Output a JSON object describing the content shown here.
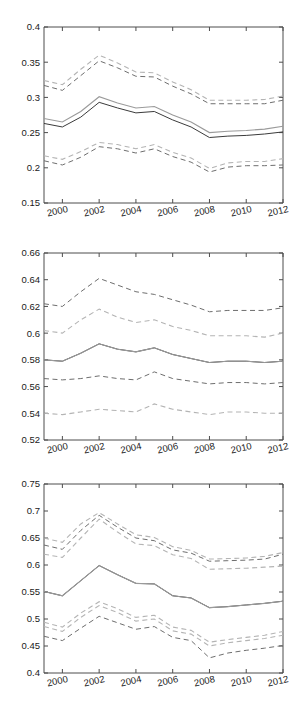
{
  "figure": {
    "background": "#ffffff",
    "panel_count": 3,
    "colors": {
      "axis": "#4d4d4d",
      "solid_dark": "#3b3b3b",
      "solid_light": "#9a9a9a",
      "dash_dark": "#6e6e6e",
      "dash_light": "#b4b4b4"
    }
  },
  "chart_data": [
    {
      "type": "line",
      "title": "",
      "xlabel": "",
      "ylabel": "",
      "grid": false,
      "legend": "none",
      "xlim": [
        1999,
        2012
      ],
      "ylim": [
        0.15,
        0.4
      ],
      "yticks": [
        0.15,
        0.2,
        0.25,
        0.3,
        0.35,
        0.4
      ],
      "ytick_labels": [
        "0.15",
        "0.2",
        "0.25",
        "0.3",
        "0.35",
        "0.4"
      ],
      "xticks": [
        2000,
        2002,
        2004,
        2006,
        2008,
        2010,
        2012
      ],
      "xtick_labels": [
        "2000",
        "2002",
        "2004",
        "2006",
        "2008",
        "2010",
        "2012"
      ],
      "x": [
        1999,
        2000,
        2001,
        2002,
        2003,
        2004,
        2005,
        2006,
        2007,
        2008,
        2009,
        2010,
        2011,
        2012
      ],
      "series": [
        {
          "name": "estimate-dark",
          "style": "solid",
          "color": "#3b3b3b",
          "values": [
            0.263,
            0.258,
            0.272,
            0.293,
            0.285,
            0.278,
            0.28,
            0.268,
            0.258,
            0.243,
            0.245,
            0.246,
            0.248,
            0.251
          ]
        },
        {
          "name": "estimate-light",
          "style": "solid",
          "color": "#9a9a9a",
          "values": [
            0.27,
            0.265,
            0.28,
            0.301,
            0.292,
            0.285,
            0.287,
            0.275,
            0.265,
            0.25,
            0.252,
            0.253,
            0.255,
            0.259
          ]
        },
        {
          "name": "upper-ci-dark",
          "style": "dashed",
          "color": "#6e6e6e",
          "values": [
            0.317,
            0.31,
            0.331,
            0.352,
            0.342,
            0.33,
            0.329,
            0.316,
            0.305,
            0.291,
            0.291,
            0.291,
            0.291,
            0.296
          ]
        },
        {
          "name": "upper-ci-light",
          "style": "dashed",
          "color": "#b4b4b4",
          "values": [
            0.324,
            0.318,
            0.34,
            0.36,
            0.349,
            0.336,
            0.335,
            0.322,
            0.311,
            0.296,
            0.296,
            0.296,
            0.297,
            0.302
          ]
        },
        {
          "name": "lower-ci-dark",
          "style": "dashed",
          "color": "#6e6e6e",
          "values": [
            0.21,
            0.204,
            0.215,
            0.23,
            0.227,
            0.221,
            0.227,
            0.216,
            0.208,
            0.194,
            0.201,
            0.203,
            0.203,
            0.204
          ]
        },
        {
          "name": "lower-ci-light",
          "style": "dashed",
          "color": "#b4b4b4",
          "values": [
            0.217,
            0.212,
            0.223,
            0.236,
            0.233,
            0.227,
            0.233,
            0.222,
            0.214,
            0.199,
            0.207,
            0.209,
            0.209,
            0.213
          ]
        }
      ]
    },
    {
      "type": "line",
      "title": "",
      "xlabel": "",
      "ylabel": "",
      "grid": false,
      "legend": "none",
      "xlim": [
        1999,
        2012
      ],
      "ylim": [
        0.52,
        0.66
      ],
      "yticks": [
        0.52,
        0.54,
        0.56,
        0.58,
        0.6,
        0.62,
        0.64,
        0.66
      ],
      "ytick_labels": [
        "0.52",
        "0.54",
        "0.56",
        "0.58",
        "0.6",
        "0.62",
        "0.64",
        "0.66"
      ],
      "xticks": [
        2000,
        2002,
        2004,
        2006,
        2008,
        2010,
        2012
      ],
      "xtick_labels": [
        "2000",
        "2002",
        "2004",
        "2006",
        "2008",
        "2010",
        "2012"
      ],
      "x": [
        1999,
        2000,
        2001,
        2002,
        2003,
        2004,
        2005,
        2006,
        2007,
        2008,
        2009,
        2010,
        2011,
        2012
      ],
      "series": [
        {
          "name": "estimate-dark",
          "style": "solid",
          "color": "#3b3b3b",
          "values": [
            0.58,
            0.579,
            0.585,
            0.592,
            0.588,
            0.586,
            0.589,
            0.584,
            0.581,
            0.578,
            0.579,
            0.579,
            0.578,
            0.579
          ]
        },
        {
          "name": "estimate-light",
          "style": "solid",
          "color": "#9a9a9a",
          "values": [
            0.58,
            0.579,
            0.585,
            0.592,
            0.588,
            0.586,
            0.589,
            0.584,
            0.581,
            0.578,
            0.579,
            0.579,
            0.578,
            0.579
          ]
        },
        {
          "name": "upper-ci-dark",
          "style": "dashed",
          "color": "#6e6e6e",
          "values": [
            0.622,
            0.62,
            0.631,
            0.641,
            0.636,
            0.631,
            0.629,
            0.625,
            0.621,
            0.616,
            0.617,
            0.617,
            0.617,
            0.619
          ]
        },
        {
          "name": "upper-ci-light",
          "style": "dashed",
          "color": "#b4b4b4",
          "values": [
            0.602,
            0.6,
            0.61,
            0.618,
            0.612,
            0.608,
            0.61,
            0.605,
            0.602,
            0.598,
            0.598,
            0.598,
            0.597,
            0.6
          ]
        },
        {
          "name": "lower-ci-dark",
          "style": "dashed",
          "color": "#6e6e6e",
          "values": [
            0.566,
            0.565,
            0.566,
            0.568,
            0.566,
            0.565,
            0.571,
            0.566,
            0.564,
            0.562,
            0.563,
            0.563,
            0.562,
            0.563
          ]
        },
        {
          "name": "lower-ci-light",
          "style": "dashed",
          "color": "#b4b4b4",
          "values": [
            0.54,
            0.539,
            0.541,
            0.543,
            0.542,
            0.541,
            0.547,
            0.543,
            0.541,
            0.539,
            0.541,
            0.541,
            0.54,
            0.54
          ]
        }
      ]
    },
    {
      "type": "line",
      "title": "",
      "xlabel": "",
      "ylabel": "",
      "grid": false,
      "legend": "none",
      "xlim": [
        1999,
        2012
      ],
      "ylim": [
        0.4,
        0.75
      ],
      "yticks": [
        0.4,
        0.45,
        0.5,
        0.55,
        0.6,
        0.65,
        0.7,
        0.75
      ],
      "ytick_labels": [
        "0.4",
        "0.45",
        "0.5",
        "0.55",
        "0.6",
        "0.65",
        "0.7",
        "0.75"
      ],
      "xticks": [
        2000,
        2002,
        2004,
        2006,
        2008,
        2010,
        2012
      ],
      "xtick_labels": [
        "2000",
        "2002",
        "2004",
        "2006",
        "2008",
        "2010",
        "2012"
      ],
      "x": [
        1999,
        2000,
        2001,
        2002,
        2003,
        2004,
        2005,
        2006,
        2007,
        2008,
        2009,
        2010,
        2011,
        2012
      ],
      "series": [
        {
          "name": "estimate-dark",
          "style": "solid",
          "color": "#3b3b3b",
          "values": [
            0.551,
            0.543,
            0.571,
            0.599,
            0.582,
            0.566,
            0.565,
            0.543,
            0.539,
            0.521,
            0.523,
            0.526,
            0.529,
            0.533
          ]
        },
        {
          "name": "estimate-light",
          "style": "solid",
          "color": "#9a9a9a",
          "values": [
            0.551,
            0.543,
            0.571,
            0.599,
            0.582,
            0.566,
            0.565,
            0.543,
            0.539,
            0.521,
            0.523,
            0.526,
            0.529,
            0.533
          ]
        },
        {
          "name": "upper-ci-dark",
          "style": "dashed",
          "color": "#6e6e6e",
          "values": [
            0.637,
            0.629,
            0.664,
            0.692,
            0.67,
            0.65,
            0.645,
            0.628,
            0.622,
            0.607,
            0.608,
            0.609,
            0.611,
            0.62
          ]
        },
        {
          "name": "upper-ci-light",
          "style": "dashed",
          "color": "#b4b4b4",
          "values": [
            0.65,
            0.642,
            0.676,
            0.697,
            0.676,
            0.656,
            0.651,
            0.634,
            0.627,
            0.611,
            0.612,
            0.613,
            0.616,
            0.623
          ]
        },
        {
          "name": "upper-ci-outer",
          "style": "dashed",
          "color": "#b4b4b4",
          "values": [
            0.62,
            0.614,
            0.65,
            0.685,
            0.661,
            0.639,
            0.636,
            0.619,
            0.612,
            0.592,
            0.593,
            0.594,
            0.596,
            0.598
          ]
        },
        {
          "name": "lower-ci-dark",
          "style": "dashed",
          "color": "#6e6e6e",
          "values": [
            0.468,
            0.46,
            0.483,
            0.505,
            0.493,
            0.481,
            0.486,
            0.466,
            0.46,
            0.428,
            0.437,
            0.442,
            0.446,
            0.451
          ]
        },
        {
          "name": "lower-ci-light",
          "style": "dashed",
          "color": "#b4b4b4",
          "values": [
            0.494,
            0.485,
            0.511,
            0.532,
            0.519,
            0.503,
            0.507,
            0.485,
            0.479,
            0.457,
            0.462,
            0.466,
            0.47,
            0.477
          ]
        },
        {
          "name": "lower-ci-mid",
          "style": "dashed",
          "color": "#b4b4b4",
          "values": [
            0.486,
            0.477,
            0.503,
            0.525,
            0.512,
            0.496,
            0.5,
            0.478,
            0.472,
            0.45,
            0.456,
            0.46,
            0.464,
            0.47
          ]
        }
      ]
    }
  ]
}
